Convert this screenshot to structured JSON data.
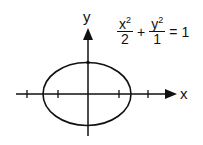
{
  "diagram": {
    "axes": {
      "x_label": "x",
      "y_label": "y"
    },
    "equation": {
      "term1": {
        "numerator": "x",
        "exponent": "2",
        "denominator": "2"
      },
      "plus": "+",
      "term2": {
        "numerator": "y",
        "exponent": "2",
        "denominator": "1"
      },
      "equals": "=",
      "rhs": "1"
    },
    "ellipse": {
      "semi_major_x": "√2",
      "semi_minor_y": "1"
    },
    "colors": {
      "stroke": "#111111",
      "background": "#ffffff"
    }
  }
}
